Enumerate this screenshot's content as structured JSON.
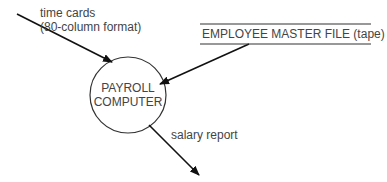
{
  "diagram": {
    "process": {
      "line1": "PAYROLL",
      "line2": "COMPUTER"
    },
    "input_flow": {
      "line1": "time cards",
      "line2": "(80-column format)"
    },
    "data_store": {
      "label": "EMPLOYEE MASTER FILE (tape)"
    },
    "output_flow": {
      "label": "salary report"
    }
  }
}
